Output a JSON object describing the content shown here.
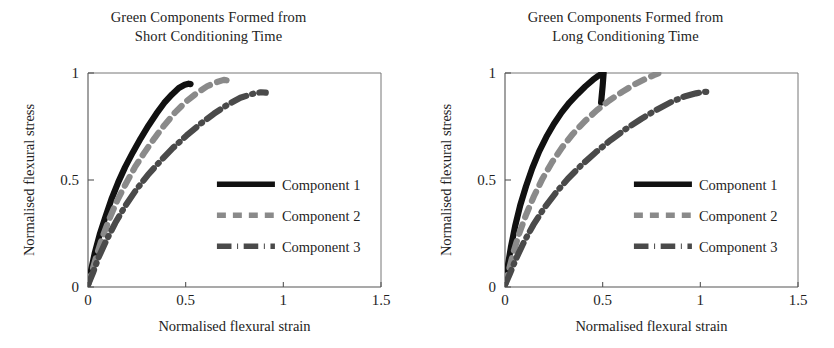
{
  "figure": {
    "width": 834,
    "height": 348,
    "background": "#ffffff"
  },
  "panels": [
    {
      "id": "short-conditioning",
      "title_line1": "Green Components Formed from",
      "title_line2": "Short Conditioning Time"
    },
    {
      "id": "long-conditioning",
      "title_line1": "Green Components Formed from",
      "title_line2": "Long Conditioning Time"
    }
  ],
  "legend": {
    "items": [
      {
        "label": "Component 1",
        "style": "solid",
        "color": "#111111"
      },
      {
        "label": "Component 2",
        "style": "dashed",
        "color": "#8a8a8a"
      },
      {
        "label": "Component 3",
        "style": "dash-dot",
        "color": "#4a4a4a"
      }
    ]
  },
  "chart_data": [
    {
      "type": "line",
      "title": "Green Components Formed from Short Conditioning Time",
      "xlabel": "Normalised flexural strain",
      "ylabel": "Normalised flexural stress",
      "xlim": [
        0,
        1.5
      ],
      "ylim": [
        0,
        1
      ],
      "xticks": [
        0,
        0.5,
        1,
        1.5
      ],
      "xticklabels": [
        "0",
        "0.5",
        "1",
        "1.5"
      ],
      "yticks": [
        0,
        0.5,
        1
      ],
      "yticklabels": [
        "0",
        "0.5",
        "1"
      ],
      "grid": false,
      "legend_position": "lower-right-inside",
      "series": [
        {
          "name": "Component 1",
          "style": "solid",
          "color": "#111111",
          "x": [
            0.0,
            0.015,
            0.035,
            0.06,
            0.09,
            0.12,
            0.155,
            0.19,
            0.23,
            0.27,
            0.31,
            0.35,
            0.39,
            0.43,
            0.465,
            0.495,
            0.515,
            0.525
          ],
          "y": [
            0.01,
            0.075,
            0.16,
            0.245,
            0.33,
            0.41,
            0.49,
            0.56,
            0.63,
            0.695,
            0.755,
            0.81,
            0.86,
            0.9,
            0.93,
            0.945,
            0.95,
            0.948
          ]
        },
        {
          "name": "Component 2",
          "style": "dashed",
          "color": "#8a8a8a",
          "x": [
            0.0,
            0.02,
            0.045,
            0.075,
            0.11,
            0.15,
            0.195,
            0.24,
            0.29,
            0.34,
            0.39,
            0.445,
            0.5,
            0.555,
            0.61,
            0.66,
            0.695,
            0.715
          ],
          "y": [
            0.01,
            0.07,
            0.15,
            0.235,
            0.32,
            0.405,
            0.485,
            0.56,
            0.63,
            0.695,
            0.755,
            0.815,
            0.865,
            0.905,
            0.938,
            0.958,
            0.968,
            0.965
          ]
        },
        {
          "name": "Component 3",
          "style": "dash-dot",
          "color": "#4a4a4a",
          "x": [
            0.0,
            0.025,
            0.055,
            0.095,
            0.14,
            0.19,
            0.245,
            0.305,
            0.37,
            0.435,
            0.505,
            0.575,
            0.645,
            0.715,
            0.78,
            0.84,
            0.885,
            0.91
          ],
          "y": [
            0.01,
            0.065,
            0.14,
            0.22,
            0.3,
            0.378,
            0.452,
            0.522,
            0.588,
            0.65,
            0.708,
            0.762,
            0.81,
            0.852,
            0.884,
            0.902,
            0.91,
            0.908
          ]
        }
      ]
    },
    {
      "type": "line",
      "title": "Green Components Formed from Long Conditioning Time",
      "xlabel": "Normalised flexural strain",
      "ylabel": "Normalised flexural stress",
      "xlim": [
        0,
        1.5
      ],
      "ylim": [
        0,
        1
      ],
      "xticks": [
        0,
        0.5,
        1,
        1.5
      ],
      "xticklabels": [
        "0",
        "0.5",
        "1",
        "1.5"
      ],
      "yticks": [
        0,
        0.5,
        1
      ],
      "yticklabels": [
        "0",
        "0.5",
        "1"
      ],
      "grid": false,
      "legend_position": "lower-right-inside",
      "series": [
        {
          "name": "Component 1",
          "style": "solid",
          "color": "#111111",
          "x": [
            0.0,
            0.012,
            0.03,
            0.052,
            0.078,
            0.108,
            0.14,
            0.175,
            0.212,
            0.25,
            0.29,
            0.33,
            0.372,
            0.412,
            0.45,
            0.48,
            0.498,
            0.505,
            0.5,
            0.492
          ],
          "y": [
            0.01,
            0.085,
            0.185,
            0.285,
            0.382,
            0.472,
            0.556,
            0.634,
            0.702,
            0.762,
            0.816,
            0.862,
            0.902,
            0.938,
            0.968,
            0.988,
            0.998,
            1.0,
            0.94,
            0.862
          ]
        },
        {
          "name": "Component 2",
          "style": "dashed",
          "color": "#8a8a8a",
          "x": [
            0.0,
            0.018,
            0.042,
            0.072,
            0.108,
            0.148,
            0.192,
            0.24,
            0.292,
            0.348,
            0.408,
            0.47,
            0.535,
            0.6,
            0.662,
            0.718,
            0.762,
            0.785
          ],
          "y": [
            0.01,
            0.072,
            0.158,
            0.248,
            0.338,
            0.424,
            0.506,
            0.582,
            0.652,
            0.716,
            0.774,
            0.826,
            0.872,
            0.912,
            0.946,
            0.972,
            0.99,
            0.998
          ]
        },
        {
          "name": "Component 3",
          "style": "dash-dot",
          "color": "#4a4a4a",
          "x": [
            0.0,
            0.025,
            0.058,
            0.098,
            0.145,
            0.198,
            0.258,
            0.322,
            0.392,
            0.465,
            0.54,
            0.618,
            0.698,
            0.775,
            0.85,
            0.918,
            0.978,
            1.02,
            1.05
          ],
          "y": [
            0.01,
            0.062,
            0.135,
            0.212,
            0.29,
            0.366,
            0.438,
            0.506,
            0.57,
            0.63,
            0.686,
            0.738,
            0.786,
            0.828,
            0.864,
            0.89,
            0.905,
            0.912,
            0.912
          ]
        }
      ]
    }
  ]
}
